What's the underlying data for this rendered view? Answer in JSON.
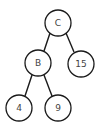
{
  "diagram": {
    "type": "binary-tree",
    "nodes": [
      {
        "id": "C",
        "label": "C",
        "cx": 58,
        "cy": 23,
        "r": 13
      },
      {
        "id": "B",
        "label": "B",
        "cx": 38,
        "cy": 63,
        "r": 13
      },
      {
        "id": "15",
        "label": "15",
        "cx": 81,
        "cy": 64,
        "r": 13
      },
      {
        "id": "4",
        "label": "4",
        "cx": 19,
        "cy": 108,
        "r": 13
      },
      {
        "id": "9",
        "label": "9",
        "cx": 58,
        "cy": 108,
        "r": 13
      }
    ],
    "edges": [
      {
        "from": "C",
        "to": "B"
      },
      {
        "from": "C",
        "to": "15"
      },
      {
        "from": "B",
        "to": "4"
      },
      {
        "from": "B",
        "to": "9"
      }
    ]
  }
}
